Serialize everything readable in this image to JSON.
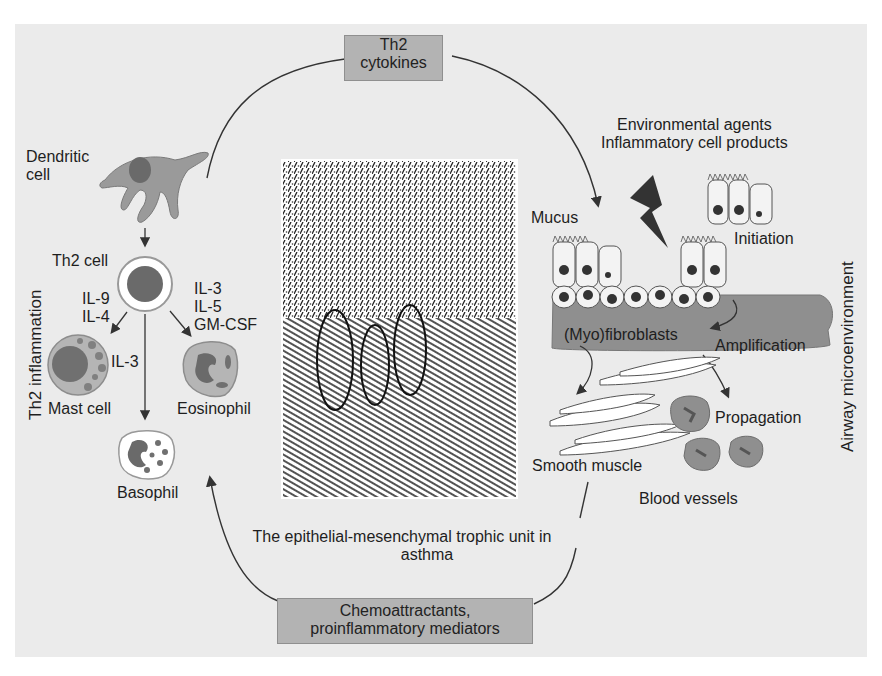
{
  "diagram": {
    "boxes": {
      "th2_cytokines": [
        "Th2",
        "cytokines"
      ],
      "chemoattractants": [
        "Chemoattractants,",
        "proinflammatory mediators"
      ]
    },
    "left_panel": {
      "side_title": "Th2 inflammation",
      "dendritic_cell": [
        "Dendritic",
        "cell"
      ],
      "th2_cell": "Th2 cell",
      "il_left": [
        "IL-9",
        "IL-4"
      ],
      "il_right": [
        "IL-3",
        "IL-5",
        "GM-CSF"
      ],
      "il_mast": "IL-3",
      "mast_cell": "Mast cell",
      "eosinophil": "Eosinophil",
      "basophil": "Basophil"
    },
    "right_panel": {
      "side_title": "Airway microenvironment",
      "agents": [
        "Environmental agents",
        "Inflammatory cell products"
      ],
      "mucus": "Mucus",
      "initiation": "Initiation",
      "myofibroblasts": "(Myo)fibroblasts",
      "amplification": "Amplification",
      "propagation": "Propagation",
      "smooth_muscle": "Smooth muscle",
      "blood_vessels": "Blood vessels"
    },
    "center_caption": [
      "The epithelial-mesenchymal trophic unit in",
      "asthma"
    ],
    "colors": {
      "background": "#ebebeb",
      "box_fill": "#b3b3b3",
      "cell_gray": "#9a9a9a",
      "nucleus": "#6a6a6a",
      "band": "#8f8f8f"
    }
  }
}
